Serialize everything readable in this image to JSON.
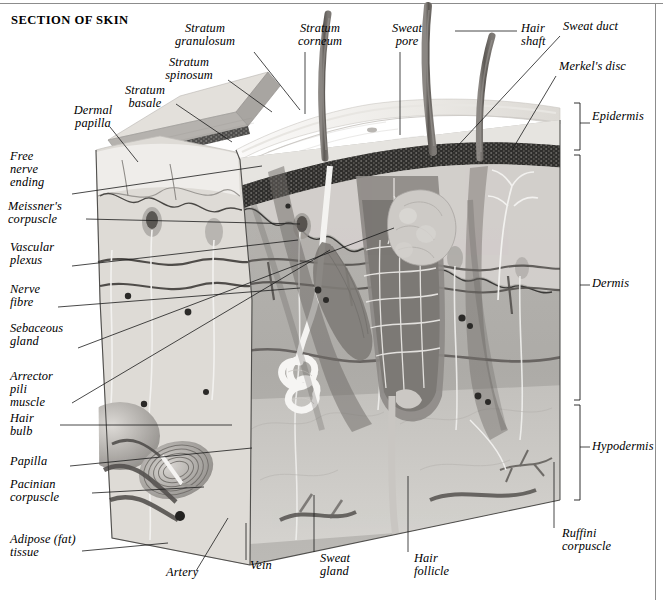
{
  "page_title": "SECTION OF SKIN",
  "diagram": {
    "palette": {
      "background": "#ffffff",
      "leader_line": "#1a1a1a",
      "epidermis_surface": "#e9e7e4",
      "stratum_corneum": "#d9d6d1",
      "stratum_granulosum": "#3a3a3a",
      "dermis": "#b2b0ac",
      "hypodermis": "#c9c7c3",
      "hair_shaft": "#6e6a66",
      "vessel_dark": "#4a4845",
      "nerve_light": "#f2f1ef"
    }
  },
  "labels": {
    "top": [
      {
        "id": "stratum-granulosum",
        "text": "Stratum\ngranulosum",
        "x": 200,
        "y": 28,
        "align": "center"
      },
      {
        "id": "stratum-corneum",
        "text": "Stratum\ncorneum",
        "x": 320,
        "y": 28,
        "align": "center"
      },
      {
        "id": "sweat-pore",
        "text": "Sweat\npore",
        "x": 408,
        "y": 28,
        "align": "center"
      },
      {
        "id": "hair-shaft",
        "text": "Hair\nshaft",
        "x": 523,
        "y": 28,
        "align": "left"
      },
      {
        "id": "sweat-duct",
        "text": "Sweat duct",
        "x": 565,
        "y": 26,
        "align": "left"
      },
      {
        "id": "stratum-spinosum",
        "text": "Stratum\nspinosum",
        "x": 188,
        "y": 62,
        "align": "center"
      },
      {
        "id": "merkels-disc",
        "text": "Merkel's disc",
        "x": 561,
        "y": 67,
        "align": "left"
      },
      {
        "id": "stratum-basale",
        "text": "Stratum\nbasale",
        "x": 146,
        "y": 90,
        "align": "center"
      },
      {
        "id": "dermal-papilla",
        "text": "Dermal\npapilla",
        "x": 66,
        "y": 112,
        "align": "left"
      }
    ],
    "left": [
      {
        "id": "free-nerve-ending",
        "text": "Free\nnerve\nending",
        "x": 10,
        "y": 155
      },
      {
        "id": "meissners-corpuscle",
        "text": "Meissner's\ncorpuscle",
        "x": 10,
        "y": 203
      },
      {
        "id": "vascular-plexus",
        "text": "Vascular\nplexus",
        "x": 10,
        "y": 245
      },
      {
        "id": "nerve-fibre",
        "text": "Nerve\nfibre",
        "x": 10,
        "y": 287
      },
      {
        "id": "sebaceous-gland",
        "text": "Sebaceous\ngland",
        "x": 10,
        "y": 327
      },
      {
        "id": "arrector-pili-muscle",
        "text": "Arrector\npili\nmuscle",
        "x": 10,
        "y": 370
      },
      {
        "id": "hair-bulb",
        "text": "Hair\nbulb",
        "x": 10,
        "y": 418
      },
      {
        "id": "papilla",
        "text": "Papilla",
        "x": 10,
        "y": 460
      },
      {
        "id": "pacinian-corpuscle",
        "text": "Pacinian\ncorpuscle",
        "x": 10,
        "y": 480
      },
      {
        "id": "adipose-fat-tissue",
        "text": "Adipose (fat)\ntissue",
        "x": 10,
        "y": 538
      }
    ],
    "bottom": [
      {
        "id": "artery",
        "text": "Artery",
        "x": 170,
        "y": 573
      },
      {
        "id": "vein",
        "text": "Vein",
        "x": 250,
        "y": 566
      },
      {
        "id": "sweat-gland",
        "text": "Sweat\ngland",
        "x": 318,
        "y": 559
      },
      {
        "id": "hair-follicle",
        "text": "Hair\nfollicle",
        "x": 412,
        "y": 559
      }
    ],
    "right": [
      {
        "id": "epidermis",
        "text": "Epidermis",
        "x": 592,
        "y": 117
      },
      {
        "id": "dermis",
        "text": "Dermis",
        "x": 592,
        "y": 283
      },
      {
        "id": "hypodermis",
        "text": "Hypodermis",
        "x": 592,
        "y": 440
      },
      {
        "id": "ruffini-corpuscle",
        "text": "Ruffini\ncorpuscle",
        "x": 562,
        "y": 534
      }
    ]
  },
  "brackets": [
    {
      "id": "epidermis-bracket",
      "x": 578,
      "y_top": 103,
      "y_bottom": 150,
      "tick_y": 123
    },
    {
      "id": "dermis-bracket",
      "x": 578,
      "y_top": 155,
      "y_bottom": 400,
      "tick_y": 285
    },
    {
      "id": "hypodermis-bracket",
      "x": 578,
      "y_top": 405,
      "y_bottom": 500,
      "tick_y": 447
    }
  ]
}
